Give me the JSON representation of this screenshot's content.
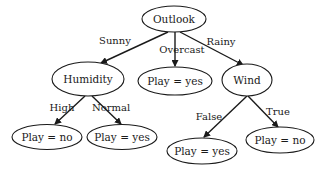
{
  "diagram": {
    "type": "decision-tree",
    "colors": {
      "stroke": "#1a1a1a",
      "fill": "#ffffff",
      "text": "#1a1a1a"
    },
    "nodes": {
      "outlook": {
        "label": "Outlook",
        "cx": 174,
        "cy": 19,
        "rx": 32,
        "ry": 13
      },
      "humidity": {
        "label": "Humidity",
        "cx": 88,
        "cy": 79,
        "rx": 36,
        "ry": 17
      },
      "overcast_leaf": {
        "label": "Play = yes",
        "cx": 175,
        "cy": 81,
        "rx": 37,
        "ry": 14
      },
      "wind": {
        "label": "Wind",
        "cx": 247,
        "cy": 80,
        "rx": 25,
        "ry": 16
      },
      "high_leaf": {
        "label": "Play = no",
        "cx": 47,
        "cy": 137,
        "rx": 35,
        "ry": 12.5
      },
      "normal_leaf": {
        "label": "Play = yes",
        "cx": 122,
        "cy": 137,
        "rx": 35,
        "ry": 12.5
      },
      "false_leaf": {
        "label": "Play = yes",
        "cx": 202,
        "cy": 151,
        "rx": 35,
        "ry": 13
      },
      "true_leaf": {
        "label": "Play = no",
        "cx": 280,
        "cy": 140,
        "rx": 34,
        "ry": 13
      }
    },
    "edges": {
      "sunny": {
        "label": "Sunny",
        "from": "outlook",
        "to": "humidity"
      },
      "overcast": {
        "label": "Overcast",
        "from": "outlook",
        "to": "overcast_leaf"
      },
      "rainy": {
        "label": "Rainy",
        "from": "outlook",
        "to": "wind"
      },
      "high": {
        "label": "High",
        "from": "humidity",
        "to": "high_leaf"
      },
      "normal": {
        "label": "Normal",
        "from": "humidity",
        "to": "normal_leaf"
      },
      "false": {
        "label": "False",
        "from": "wind",
        "to": "false_leaf"
      },
      "true": {
        "label": "True",
        "from": "wind",
        "to": "true_leaf"
      }
    }
  }
}
